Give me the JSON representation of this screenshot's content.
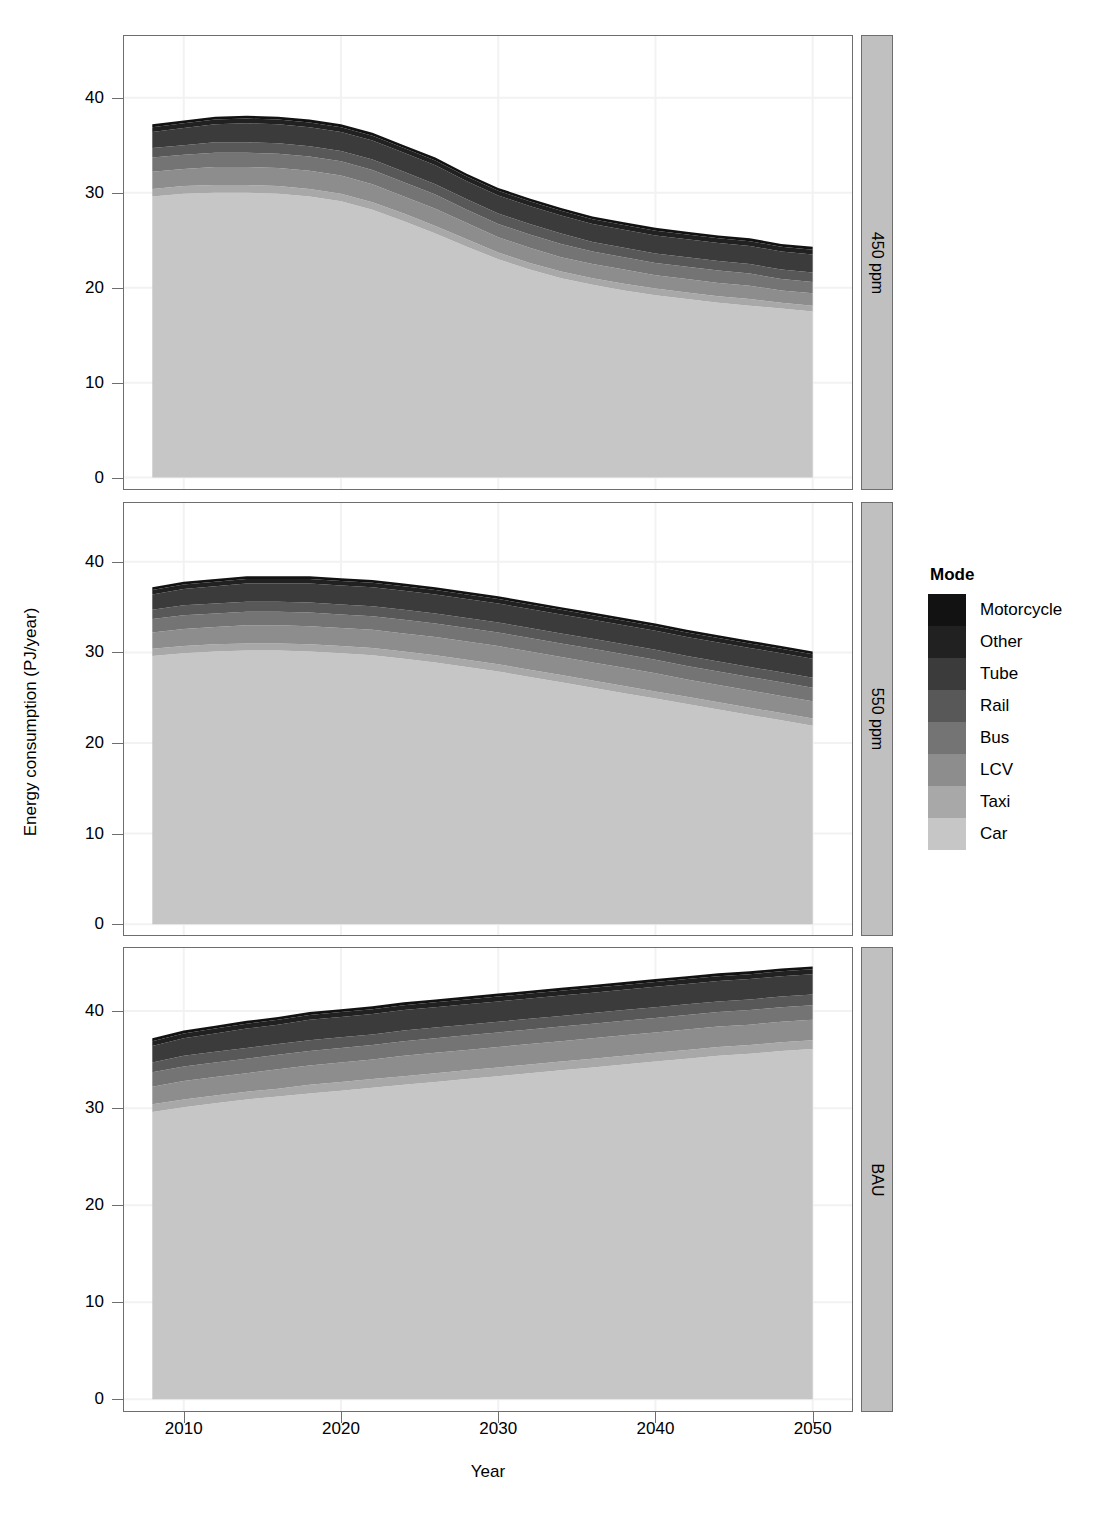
{
  "figure": {
    "xlabel": "Year",
    "ylabel": "Energy consumption (PJ/year)"
  },
  "legend": {
    "title": "Mode",
    "items": [
      {
        "label": "Motorcycle",
        "color": "#121212"
      },
      {
        "label": "Other",
        "color": "#212121"
      },
      {
        "label": "Tube",
        "color": "#3b3b3b"
      },
      {
        "label": "Rail",
        "color": "#585858"
      },
      {
        "label": "Bus",
        "color": "#747474"
      },
      {
        "label": "LCV",
        "color": "#8d8d8d"
      },
      {
        "label": "Taxi",
        "color": "#a8a8a8"
      },
      {
        "label": "Car",
        "color": "#c6c6c6"
      }
    ]
  },
  "axes": {
    "y_ticks": [
      "0",
      "10",
      "20",
      "30",
      "40"
    ],
    "y_tick_values": [
      0,
      10,
      20,
      30,
      40
    ],
    "x_ticks": [
      "2010",
      "2020",
      "2030",
      "2040",
      "2050"
    ],
    "x_tick_values": [
      2010,
      2020,
      2030,
      2040,
      2050
    ],
    "xlim": [
      2006.2,
      2052.5
    ],
    "ylim": [
      -1.2,
      46.5
    ]
  },
  "panels": [
    {
      "strip_label": "450 ppm"
    },
    {
      "strip_label": "550 ppm"
    },
    {
      "strip_label": "BAU"
    }
  ],
  "chart_data": {
    "type": "area",
    "stacked": true,
    "title": "",
    "xlabel": "Year",
    "ylabel": "Energy consumption (PJ/year)",
    "xlim": [
      2006.2,
      2052.5
    ],
    "ylim": [
      -1.2,
      46.5
    ],
    "grid": true,
    "legend_title": "Mode",
    "legend_position": "right",
    "legend_entries": [
      "Motorcycle",
      "Other",
      "Tube",
      "Rail",
      "Bus",
      "LCV",
      "Taxi",
      "Car"
    ],
    "stack_order_bottom_to_top": [
      "Car",
      "Taxi",
      "LCV",
      "Bus",
      "Rail",
      "Tube",
      "Other",
      "Motorcycle"
    ],
    "colors": {
      "Motorcycle": "#121212",
      "Other": "#212121",
      "Tube": "#3b3b3b",
      "Rail": "#585858",
      "Bus": "#747474",
      "LCV": "#8d8d8d",
      "Taxi": "#a8a8a8",
      "Car": "#c6c6c6"
    },
    "x": [
      2008,
      2010,
      2012,
      2014,
      2016,
      2018,
      2020,
      2022,
      2024,
      2026,
      2028,
      2030,
      2032,
      2034,
      2036,
      2038,
      2040,
      2042,
      2044,
      2046,
      2048,
      2050
    ],
    "panels": [
      {
        "name": "450 ppm",
        "series": [
          {
            "name": "Car",
            "values": [
              29.6,
              29.9,
              30.0,
              30.0,
              29.9,
              29.6,
              29.1,
              28.2,
              27.0,
              25.7,
              24.3,
              23.0,
              21.9,
              21.0,
              20.3,
              19.7,
              19.2,
              18.8,
              18.4,
              18.1,
              17.8,
              17.5
            ]
          },
          {
            "name": "Taxi",
            "values": [
              0.8,
              0.8,
              0.8,
              0.8,
              0.8,
              0.8,
              0.8,
              0.8,
              0.8,
              0.8,
              0.8,
              0.7,
              0.7,
              0.7,
              0.7,
              0.7,
              0.7,
              0.7,
              0.7,
              0.7,
              0.6,
              0.6
            ]
          },
          {
            "name": "LCV",
            "values": [
              1.8,
              1.8,
              1.9,
              1.9,
              1.9,
              1.9,
              1.9,
              1.9,
              1.8,
              1.8,
              1.7,
              1.6,
              1.6,
              1.5,
              1.5,
              1.5,
              1.4,
              1.4,
              1.4,
              1.4,
              1.3,
              1.3
            ]
          },
          {
            "name": "Bus",
            "values": [
              1.5,
              1.5,
              1.5,
              1.5,
              1.5,
              1.5,
              1.5,
              1.5,
              1.5,
              1.5,
              1.4,
              1.4,
              1.4,
              1.4,
              1.3,
              1.3,
              1.3,
              1.3,
              1.3,
              1.3,
              1.2,
              1.2
            ]
          },
          {
            "name": "Rail",
            "values": [
              1.0,
              1.0,
              1.1,
              1.1,
              1.1,
              1.1,
              1.1,
              1.1,
              1.1,
              1.1,
              1.1,
              1.1,
              1.1,
              1.1,
              1.0,
              1.0,
              1.0,
              1.0,
              1.0,
              1.0,
              1.0,
              1.0
            ]
          },
          {
            "name": "Tube",
            "values": [
              1.7,
              1.8,
              1.9,
              2.0,
              2.0,
              2.0,
              2.0,
              2.0,
              2.0,
              2.0,
              1.9,
              1.9,
              1.9,
              1.9,
              1.9,
              1.9,
              1.9,
              1.9,
              1.9,
              1.9,
              1.9,
              1.9
            ]
          },
          {
            "name": "Other",
            "values": [
              0.5,
              0.5,
              0.5,
              0.5,
              0.5,
              0.5,
              0.5,
              0.5,
              0.5,
              0.5,
              0.5,
              0.5,
              0.5,
              0.5,
              0.5,
              0.5,
              0.5,
              0.5,
              0.5,
              0.5,
              0.5,
              0.5
            ]
          },
          {
            "name": "Motorcycle",
            "values": [
              0.3,
              0.3,
              0.3,
              0.3,
              0.3,
              0.3,
              0.3,
              0.3,
              0.3,
              0.3,
              0.3,
              0.3,
              0.3,
              0.3,
              0.3,
              0.3,
              0.3,
              0.3,
              0.3,
              0.3,
              0.3,
              0.3
            ]
          }
        ],
        "totals": [
          36.8,
          37.0,
          37.1,
          37.1,
          37.0,
          36.7,
          36.2,
          35.3,
          34.1,
          32.8,
          31.3,
          30.0,
          28.8,
          27.9,
          27.2,
          26.6,
          26.1,
          25.6,
          25.2,
          24.9,
          24.6,
          24.3
        ]
      },
      {
        "name": "550 ppm",
        "series": [
          {
            "name": "Car",
            "values": [
              29.6,
              29.9,
              30.1,
              30.2,
              30.2,
              30.1,
              29.9,
              29.7,
              29.3,
              28.9,
              28.4,
              27.9,
              27.3,
              26.7,
              26.1,
              25.5,
              24.9,
              24.3,
              23.7,
              23.1,
              22.5,
              21.9
            ]
          },
          {
            "name": "Taxi",
            "values": [
              0.8,
              0.8,
              0.8,
              0.8,
              0.8,
              0.8,
              0.8,
              0.8,
              0.8,
              0.8,
              0.8,
              0.8,
              0.8,
              0.8,
              0.8,
              0.8,
              0.8,
              0.8,
              0.8,
              0.8,
              0.8,
              0.8
            ]
          },
          {
            "name": "LCV",
            "values": [
              1.8,
              1.9,
              1.9,
              2.0,
              2.0,
              2.0,
              2.0,
              2.0,
              2.0,
              2.0,
              2.0,
              2.0,
              2.0,
              2.0,
              2.0,
              2.0,
              2.0,
              1.9,
              1.9,
              1.9,
              1.9,
              1.9
            ]
          },
          {
            "name": "Bus",
            "values": [
              1.5,
              1.5,
              1.5,
              1.5,
              1.5,
              1.5,
              1.5,
              1.5,
              1.5,
              1.5,
              1.5,
              1.5,
              1.5,
              1.5,
              1.5,
              1.5,
              1.5,
              1.5,
              1.5,
              1.5,
              1.5,
              1.5
            ]
          },
          {
            "name": "Rail",
            "values": [
              1.0,
              1.1,
              1.1,
              1.1,
              1.1,
              1.1,
              1.1,
              1.1,
              1.1,
              1.1,
              1.1,
              1.1,
              1.1,
              1.1,
              1.1,
              1.1,
              1.1,
              1.1,
              1.1,
              1.1,
              1.1,
              1.1
            ]
          },
          {
            "name": "Tube",
            "values": [
              1.7,
              1.8,
              1.9,
              2.0,
              2.0,
              2.1,
              2.1,
              2.1,
              2.1,
              2.1,
              2.1,
              2.1,
              2.1,
              2.1,
              2.1,
              2.1,
              2.1,
              2.1,
              2.1,
              2.1,
              2.1,
              2.1
            ]
          },
          {
            "name": "Other",
            "values": [
              0.5,
              0.5,
              0.5,
              0.5,
              0.5,
              0.5,
              0.5,
              0.5,
              0.5,
              0.5,
              0.5,
              0.5,
              0.5,
              0.5,
              0.5,
              0.5,
              0.5,
              0.5,
              0.5,
              0.5,
              0.5,
              0.5
            ]
          },
          {
            "name": "Motorcycle",
            "values": [
              0.3,
              0.3,
              0.3,
              0.3,
              0.3,
              0.3,
              0.3,
              0.3,
              0.3,
              0.3,
              0.3,
              0.3,
              0.3,
              0.3,
              0.3,
              0.3,
              0.3,
              0.3,
              0.3,
              0.3,
              0.3,
              0.3
            ]
          }
        ],
        "totals": [
          36.8,
          37.1,
          37.3,
          37.3,
          37.3,
          37.2,
          37.1,
          36.9,
          36.5,
          36.1,
          35.6,
          35.1,
          34.5,
          33.9,
          33.3,
          32.7,
          32.1,
          31.4,
          30.8,
          30.2,
          29.6,
          30.2
        ]
      },
      {
        "name": "BAU",
        "series": [
          {
            "name": "Car",
            "values": [
              29.6,
              30.1,
              30.5,
              30.9,
              31.2,
              31.5,
              31.8,
              32.1,
              32.4,
              32.7,
              33.0,
              33.3,
              33.6,
              33.9,
              34.2,
              34.5,
              34.8,
              35.1,
              35.4,
              35.6,
              35.9,
              36.1
            ]
          },
          {
            "name": "Taxi",
            "values": [
              0.8,
              0.8,
              0.8,
              0.8,
              0.8,
              0.9,
              0.9,
              0.9,
              0.9,
              0.9,
              0.9,
              0.9,
              0.9,
              0.9,
              0.9,
              0.9,
              0.9,
              0.9,
              0.9,
              0.9,
              0.9,
              0.9
            ]
          },
          {
            "name": "LCV",
            "values": [
              1.8,
              1.9,
              1.9,
              1.9,
              2.0,
              2.0,
              2.0,
              2.0,
              2.1,
              2.1,
              2.1,
              2.1,
              2.1,
              2.1,
              2.1,
              2.1,
              2.1,
              2.1,
              2.1,
              2.1,
              2.1,
              2.1
            ]
          },
          {
            "name": "Bus",
            "values": [
              1.5,
              1.5,
              1.5,
              1.5,
              1.5,
              1.5,
              1.5,
              1.5,
              1.5,
              1.5,
              1.5,
              1.5,
              1.5,
              1.5,
              1.5,
              1.5,
              1.5,
              1.5,
              1.5,
              1.5,
              1.5,
              1.5
            ]
          },
          {
            "name": "Rail",
            "values": [
              1.0,
              1.1,
              1.1,
              1.1,
              1.1,
              1.1,
              1.1,
              1.1,
              1.1,
              1.1,
              1.1,
              1.1,
              1.1,
              1.1,
              1.1,
              1.1,
              1.1,
              1.1,
              1.1,
              1.1,
              1.1,
              1.1
            ]
          },
          {
            "name": "Tube",
            "values": [
              1.7,
              1.8,
              1.9,
              2.0,
              2.0,
              2.1,
              2.1,
              2.1,
              2.1,
              2.1,
              2.1,
              2.1,
              2.1,
              2.1,
              2.1,
              2.1,
              2.1,
              2.1,
              2.1,
              2.1,
              2.1,
              2.1
            ]
          },
          {
            "name": "Other",
            "values": [
              0.5,
              0.5,
              0.5,
              0.5,
              0.5,
              0.5,
              0.5,
              0.5,
              0.5,
              0.5,
              0.5,
              0.5,
              0.5,
              0.5,
              0.5,
              0.5,
              0.5,
              0.5,
              0.5,
              0.5,
              0.5,
              0.5
            ]
          },
          {
            "name": "Motorcycle",
            "values": [
              0.3,
              0.3,
              0.3,
              0.3,
              0.3,
              0.3,
              0.3,
              0.3,
              0.3,
              0.3,
              0.3,
              0.3,
              0.3,
              0.3,
              0.3,
              0.3,
              0.3,
              0.3,
              0.3,
              0.3,
              0.3,
              0.3
            ]
          }
        ],
        "totals": [
          36.8,
          37.5,
          37.8,
          38.2,
          38.5,
          38.9,
          39.2,
          39.5,
          39.9,
          40.2,
          40.5,
          40.8,
          41.1,
          41.4,
          41.7,
          42.0,
          42.3,
          42.6,
          42.9,
          43.1,
          43.4,
          43.6
        ]
      }
    ]
  }
}
